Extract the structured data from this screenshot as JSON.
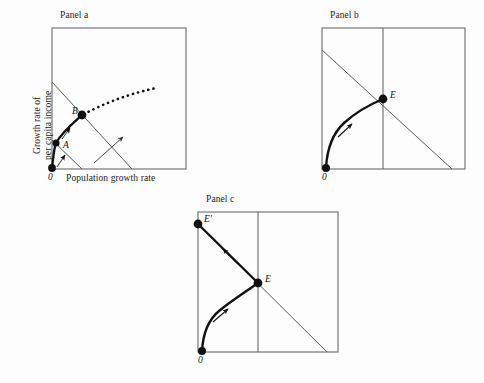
{
  "figure": {
    "kind": "economics-diagram",
    "background_color": "#fdfdfd",
    "line_color": "#4a4a4a",
    "curve_color": "#111111",
    "dot_color": "#111111",
    "width": 484,
    "height": 383
  },
  "panels": [
    {
      "id": "a",
      "title": "Panel a",
      "title_pos": {
        "x": 60,
        "y": 12
      },
      "box": {
        "x": 52,
        "y": 28,
        "w": 134,
        "h": 141
      },
      "axes": {
        "ylabel_line1": "Growth rate of",
        "ylabel_line2": "per capita income",
        "xlabel": "Population growth rate",
        "origin": "0"
      },
      "lines": [
        {
          "name": "savings-line-upper",
          "x1": 52,
          "y1": 82,
          "x2": 132,
          "y2": 169
        },
        {
          "name": "savings-line-lower",
          "x1": 52,
          "y1": 140,
          "x2": 82,
          "y2": 169
        }
      ],
      "solid_curve": {
        "name": "growth-path-A-to-B",
        "from": [
          52,
          168
        ],
        "to": [
          82,
          115
        ]
      },
      "dotted_curve": {
        "name": "dotted-extension",
        "from": [
          82,
          115
        ],
        "to": [
          156,
          88
        ]
      },
      "points": [
        {
          "label": "0",
          "x": 52,
          "y": 168,
          "label_dx": -4,
          "label_dy": 8,
          "italic": true
        },
        {
          "label": "A",
          "x": 56,
          "y": 143,
          "label_dx": 6,
          "label_dy": 3,
          "italic": true
        },
        {
          "label": "B",
          "x": 82,
          "y": 115,
          "label_dx": -9,
          "label_dy": -1,
          "italic": true
        }
      ],
      "arrows": [
        {
          "name": "arrow-origin-to-A",
          "x1": 57,
          "y1": 167,
          "x2": 64,
          "y2": 155
        },
        {
          "name": "arrow-A-to-B",
          "x1": 62,
          "y1": 139,
          "x2": 70,
          "y2": 127
        },
        {
          "name": "arrow-shift-indicator",
          "x1": 94,
          "y1": 163,
          "x2": 124,
          "y2": 136
        }
      ]
    },
    {
      "id": "b",
      "title": "Panel b",
      "title_pos": {
        "x": 330,
        "y": 12
      },
      "box": {
        "x": 322,
        "y": 28,
        "w": 143,
        "h": 141
      },
      "axes": {
        "origin": "0"
      },
      "lines": [
        {
          "name": "downward-sloping-line",
          "x1": 322,
          "y1": 50,
          "x2": 452,
          "y2": 169
        },
        {
          "name": "vertical-line",
          "x1": 383,
          "y1": 28,
          "x2": 383,
          "y2": 169
        }
      ],
      "solid_curve": {
        "name": "growth-path-to-E",
        "from": [
          326,
          168
        ],
        "to": [
          383,
          99
        ]
      },
      "points": [
        {
          "label": "0",
          "x": 326,
          "y": 168,
          "label_dx": -3,
          "label_dy": 9,
          "italic": true
        },
        {
          "label": "E",
          "x": 383,
          "y": 99,
          "label_dx": 6,
          "label_dy": -2,
          "italic": true
        }
      ],
      "arrows": [
        {
          "name": "arrow-along-path",
          "x1": 340,
          "y1": 135,
          "x2": 352,
          "y2": 124
        }
      ]
    },
    {
      "id": "c",
      "title": "Panel c",
      "title_pos": {
        "x": 206,
        "y": 195
      },
      "box": {
        "x": 198,
        "y": 212,
        "w": 140,
        "h": 140
      },
      "axes": {
        "origin": "0"
      },
      "lines": [
        {
          "name": "downward-sloping-line",
          "x1": 198,
          "y1": 224,
          "x2": 327,
          "y2": 352
        },
        {
          "name": "vertical-line",
          "x1": 258,
          "y1": 212,
          "x2": 258,
          "y2": 352
        }
      ],
      "solid_curve": {
        "name": "growth-path-to-E",
        "from": [
          202,
          351
        ],
        "to": [
          258,
          283
        ]
      },
      "straight_segment": {
        "name": "path-E-to-Eprime",
        "from": [
          258,
          283
        ],
        "to": [
          198,
          224
        ]
      },
      "points": [
        {
          "label": "0",
          "x": 202,
          "y": 351,
          "label_dx": -3,
          "label_dy": 9,
          "italic": true
        },
        {
          "label": "E",
          "x": 258,
          "y": 283,
          "label_dx": 7,
          "label_dy": -2,
          "italic": true
        },
        {
          "label": "E′",
          "x": 198,
          "y": 224,
          "label_dx": 6,
          "label_dy": -3,
          "italic": true
        }
      ],
      "arrows": [
        {
          "name": "arrow-along-curve",
          "x1": 214,
          "y1": 320,
          "x2": 227,
          "y2": 309
        },
        {
          "name": "arrow-E-to-Eprime",
          "x1": 236,
          "y1": 262,
          "x2": 224,
          "y2": 250
        }
      ]
    }
  ]
}
